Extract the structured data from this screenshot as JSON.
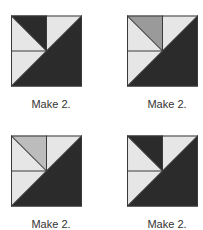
{
  "colors": {
    "dark": "#2b2b2b",
    "light": "#e6e6e6",
    "line": "#3a3a3a"
  },
  "blocks": [
    {
      "caption": "Make 2.",
      "accent_color": "#2b2b2b",
      "accent_name": "dark"
    },
    {
      "caption": "Make 2.",
      "accent_color": "#9a9a9a",
      "accent_name": "medium-gray"
    },
    {
      "caption": "Make 2.",
      "accent_color": "#bcbcbc",
      "accent_name": "light-gray"
    },
    {
      "caption": "Make 2.",
      "accent_color": "#2b2b2b",
      "accent_name": "dark"
    }
  ]
}
